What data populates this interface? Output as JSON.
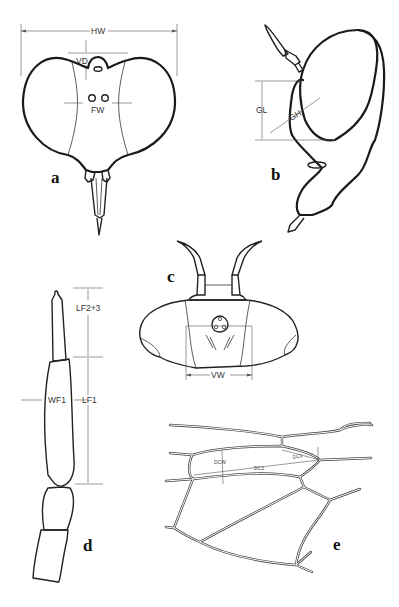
{
  "figure": {
    "panels": [
      {
        "id": "a",
        "label": "a",
        "description": "Head, frontal view",
        "measurements": {
          "hw": "HW",
          "vd": "VD",
          "fw": "FW"
        }
      },
      {
        "id": "b",
        "label": "b",
        "description": "Head, lateral view",
        "measurements": {
          "gl": "GL",
          "gh": "GH"
        }
      },
      {
        "id": "c",
        "label": "c",
        "description": "Head, dorsal view",
        "measurements": {
          "vw": "VW"
        }
      },
      {
        "id": "d",
        "label": "d",
        "description": "Antenna",
        "measurements": {
          "lf23": "LF2+3",
          "lf1": "LF1",
          "wf1": "WF1"
        }
      },
      {
        "id": "e",
        "label": "e",
        "description": "Wing venation / discal cell",
        "measurements": {
          "dcw": "DCW",
          "dc2": "DC2",
          "dc1": "DC1"
        }
      }
    ]
  }
}
